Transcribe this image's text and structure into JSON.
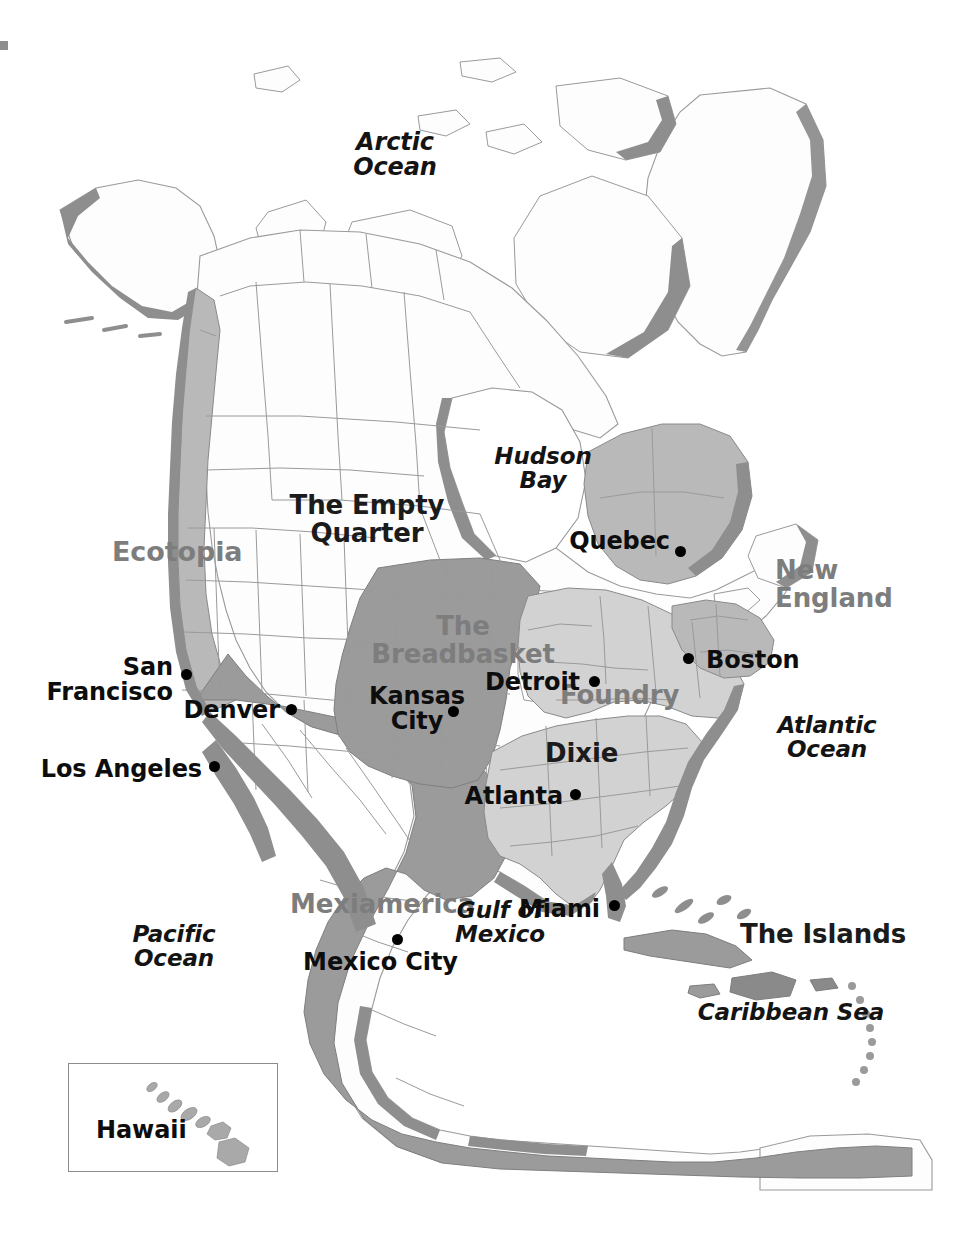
{
  "map": {
    "title": "The Nine Nations of North America",
    "background_color": "#ffffff",
    "land_fill": "#fdfdfd",
    "coast_shadow_color": "#8e8e8e",
    "border_line_color": "#9a9a9a",
    "region_fill_dark": "#9b9b9b",
    "region_fill_mid": "#b9b9b9",
    "region_fill_light": "#d2d2d2",
    "label_gray": "#7d7d7d",
    "label_dark": "#1b1b1b"
  },
  "regions": [
    {
      "id": "ecotopia",
      "label": "Ecotopia",
      "style": "gray",
      "x": 112,
      "y": 538,
      "w": 140,
      "align": "left",
      "size": 27
    },
    {
      "id": "empty-quarter",
      "label": "The Empty\nQuarter",
      "style": "dark",
      "x": 282,
      "y": 492,
      "w": 170,
      "align": "center",
      "size": 26
    },
    {
      "id": "breadbasket",
      "label": "The\nBreadbasket",
      "style": "gray",
      "x": 378,
      "y": 613,
      "w": 170,
      "align": "center",
      "size": 26
    },
    {
      "id": "foundry",
      "label": "Foundry",
      "style": "gray",
      "x": 560,
      "y": 682,
      "w": 140,
      "align": "left",
      "size": 26
    },
    {
      "id": "dixie",
      "label": "Dixie",
      "style": "dark",
      "x": 545,
      "y": 740,
      "w": 110,
      "align": "left",
      "size": 26
    },
    {
      "id": "new-england",
      "label": "New\nEngland",
      "style": "gray",
      "x": 775,
      "y": 557,
      "w": 120,
      "align": "left",
      "size": 26
    },
    {
      "id": "mexiamerica",
      "label": "Mexiamerica",
      "style": "gray",
      "x": 290,
      "y": 891,
      "w": 210,
      "align": "left",
      "size": 26
    },
    {
      "id": "the-islands",
      "label": "The Islands",
      "style": "dark",
      "x": 740,
      "y": 921,
      "w": 160,
      "align": "left",
      "size": 26
    }
  ],
  "water_labels": [
    {
      "id": "arctic-ocean",
      "label": "Arctic\nOcean",
      "x": 330,
      "y": 130,
      "w": 130,
      "align": "center",
      "size": 24
    },
    {
      "id": "hudson-bay",
      "label": "Hudson\nBay",
      "x": 488,
      "y": 444,
      "w": 120,
      "align": "center",
      "size": 23
    },
    {
      "id": "atlantic-ocean",
      "label": "Atlantic\nOcean",
      "x": 765,
      "y": 713,
      "w": 120,
      "align": "center",
      "size": 23
    },
    {
      "id": "pacific-ocean",
      "label": "Pacific\nOcean",
      "x": 118,
      "y": 922,
      "w": 110,
      "align": "center",
      "size": 23
    },
    {
      "id": "gulf-of-mexico",
      "label": "Gulf of\nMexico",
      "x": 443,
      "y": 898,
      "w": 110,
      "align": "center",
      "size": 23
    },
    {
      "id": "caribbean-sea",
      "label": "Caribbean Sea",
      "x": 686,
      "y": 1000,
      "w": 200,
      "align": "center",
      "size": 23
    }
  ],
  "cities": [
    {
      "id": "quebec",
      "label": "Quebec",
      "label_x": 605,
      "label_y": 529,
      "label_w": 105,
      "align": "right",
      "dot_x": 680,
      "dot_y": 551,
      "size": 24
    },
    {
      "id": "boston",
      "label": "Boston",
      "label_x": 706,
      "label_y": 648,
      "label_w": 100,
      "align": "left",
      "dot_x": 688,
      "dot_y": 653,
      "size": 24
    },
    {
      "id": "detroit",
      "label": "Detroit",
      "label_x": 480,
      "label_y": 670,
      "label_w": 100,
      "align": "right",
      "dot_x": 594,
      "dot_y": 678,
      "size": 24
    },
    {
      "id": "san-francisco",
      "label": "San\nFrancisco",
      "label_x": 60,
      "label_y": 655,
      "label_w": 155,
      "align": "right",
      "dot_x": 185,
      "dot_y": 672,
      "size": 24
    },
    {
      "id": "denver",
      "label": "Denver",
      "label_x": 175,
      "label_y": 698,
      "label_w": 105,
      "align": "right",
      "dot_x": 290,
      "dot_y": 706,
      "size": 24
    },
    {
      "id": "kansas-city",
      "label": "Kansas\nCity",
      "label_x": 364,
      "label_y": 684,
      "label_w": 105,
      "align": "center",
      "dot_x": 452,
      "dot_y": 709,
      "size": 24
    },
    {
      "id": "los-angeles",
      "label": "Los Angeles",
      "label_x": 60,
      "label_y": 757,
      "label_w": 155,
      "align": "right",
      "dot_x": 213,
      "dot_y": 764,
      "size": 24
    },
    {
      "id": "atlanta",
      "label": "Atlanta",
      "label_x": 473,
      "label_y": 784,
      "label_w": 105,
      "align": "right",
      "dot_x": 574,
      "dot_y": 791,
      "size": 24
    },
    {
      "id": "miami",
      "label": "Miami",
      "label_x": 540,
      "label_y": 897,
      "label_w": 105,
      "align": "right",
      "dot_x": 614,
      "dot_y": 903,
      "size": 24
    },
    {
      "id": "mexico-city",
      "label": "Mexico City",
      "label_x": 293,
      "label_y": 950,
      "label_w": 155,
      "align": "center",
      "dot_x": 396,
      "dot_y": 937,
      "size": 24
    }
  ],
  "inset": {
    "id": "hawaii-inset",
    "label": "Hawaii",
    "label_x": 96,
    "label_y": 1124,
    "label_size": 24,
    "box": {
      "x": 68,
      "y": 1063,
      "w": 208,
      "h": 107
    },
    "border_color": "#8c8c8c"
  }
}
